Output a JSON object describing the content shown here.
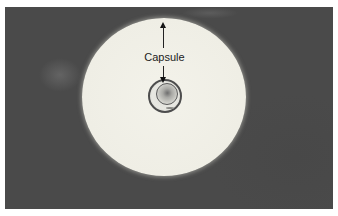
{
  "figure": {
    "label_text": "Capsule",
    "colors": {
      "background": "#4a4a4a",
      "halo": "#efeee5",
      "cell_outline": "#4d4d4d",
      "annotation": "#222222"
    },
    "elements": {
      "arrow_up": "arrow pointing to outer edge of capsule",
      "arrow_down": "arrow pointing to cell wall"
    }
  }
}
